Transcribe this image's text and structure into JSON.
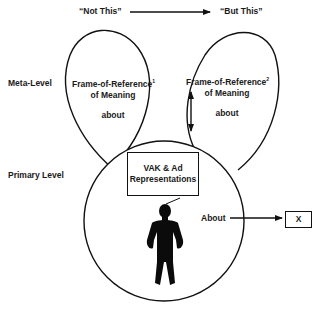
{
  "header": {
    "left_label": "“Not This”",
    "right_label": "“But This”"
  },
  "levels": {
    "meta": "Meta-Level",
    "primary": "Primary Level"
  },
  "left_frame": {
    "line1": "Frame-of-Reference",
    "sup": "1",
    "line2": "of Meaning",
    "about": "about"
  },
  "right_frame": {
    "line1": "Frame-of-Reference",
    "sup": "2",
    "line2": "of Meaning",
    "about": "about"
  },
  "vak_box": {
    "line1": "VAK & Ad",
    "line2": "Representations"
  },
  "about_arrow": {
    "label": "About",
    "target": "X"
  },
  "colors": {
    "stroke": "#111111",
    "background": "#ffffff"
  }
}
